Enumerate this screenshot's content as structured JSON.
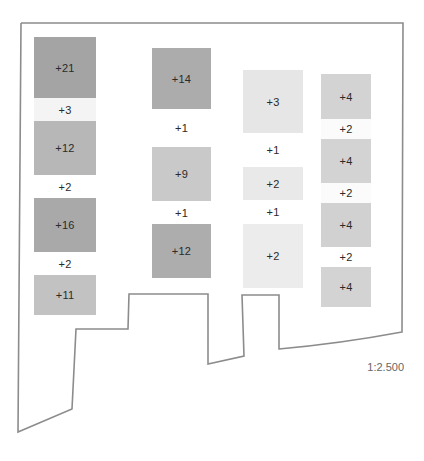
{
  "diagram": {
    "type": "site-plan-density",
    "scale_label": "1:2.500",
    "outline_color": "#8c8c8c",
    "outline_points": [
      [
        21,
        23
      ],
      [
        403,
        23
      ],
      [
        402,
        332
      ],
      [
        279,
        349
      ],
      [
        279,
        295
      ],
      [
        242,
        295
      ],
      [
        244,
        356
      ],
      [
        208,
        364
      ],
      [
        208,
        294
      ],
      [
        129,
        294
      ],
      [
        128,
        329
      ],
      [
        76,
        329
      ],
      [
        72,
        409
      ],
      [
        18,
        432
      ],
      [
        21,
        23
      ]
    ],
    "columns": [
      {
        "name": "column-1",
        "x": 34,
        "width": 62,
        "cells": [
          {
            "label": "+21",
            "top": 37,
            "height": 61,
            "color": "#a4a4a4",
            "kind": "block"
          },
          {
            "label": "+3",
            "top": 98,
            "height": 23,
            "color": "#f4f4f4",
            "kind": "gap"
          },
          {
            "label": "+12",
            "top": 121,
            "height": 54,
            "color": "#b7b7b7",
            "kind": "block"
          },
          {
            "label": "+2",
            "top": 175,
            "height": 23,
            "color": "#ffffff",
            "kind": "gap"
          },
          {
            "label": "+16",
            "top": 198,
            "height": 54,
            "color": "#a9a9a9",
            "kind": "block"
          },
          {
            "label": "+2",
            "top": 252,
            "height": 23,
            "color": "#ffffff",
            "kind": "gap"
          },
          {
            "label": "+11",
            "top": 275,
            "height": 40,
            "color": "#c2c2c2",
            "kind": "block"
          }
        ]
      },
      {
        "name": "column-2",
        "x": 152,
        "width": 59,
        "cells": [
          {
            "label": "+14",
            "top": 48,
            "height": 61,
            "color": "#acacac",
            "kind": "block"
          },
          {
            "label": "+1",
            "top": 109,
            "height": 38,
            "color": "#ffffff",
            "kind": "gap"
          },
          {
            "label": "+9",
            "top": 147,
            "height": 54,
            "color": "#c9c9c9",
            "kind": "block"
          },
          {
            "label": "+1",
            "top": 201,
            "height": 23,
            "color": "#ffffff",
            "kind": "gap"
          },
          {
            "label": "+12",
            "top": 224,
            "height": 54,
            "color": "#adadad",
            "kind": "block"
          }
        ]
      },
      {
        "name": "column-3",
        "x": 243,
        "width": 60,
        "cells": [
          {
            "label": "+3",
            "top": 70,
            "height": 63,
            "color": "#e6e6e6",
            "kind": "block"
          },
          {
            "label": "+1",
            "top": 133,
            "height": 34,
            "color": "#ffffff",
            "kind": "gap"
          },
          {
            "label": "+2",
            "top": 167,
            "height": 33,
            "color": "#e9e9e9",
            "kind": "block"
          },
          {
            "label": "+1",
            "top": 200,
            "height": 24,
            "color": "#ffffff",
            "kind": "gap"
          },
          {
            "label": "+2",
            "top": 224,
            "height": 64,
            "color": "#ececec",
            "kind": "block"
          }
        ]
      },
      {
        "name": "column-4",
        "x": 321,
        "width": 50,
        "cells": [
          {
            "label": "+4",
            "top": 74,
            "height": 45,
            "color": "#d3d3d3",
            "kind": "block"
          },
          {
            "label": "+2",
            "top": 119,
            "height": 20,
            "color": "#fbfbfb",
            "kind": "gap"
          },
          {
            "label": "+4",
            "top": 139,
            "height": 44,
            "color": "#d3d3d3",
            "kind": "block"
          },
          {
            "label": "+2",
            "top": 183,
            "height": 20,
            "color": "#fbfbfb",
            "kind": "gap"
          },
          {
            "label": "+4",
            "top": 203,
            "height": 44,
            "color": "#d1d1d1",
            "kind": "block"
          },
          {
            "label": "+2",
            "top": 247,
            "height": 20,
            "color": "#ffffff",
            "kind": "gap"
          },
          {
            "label": "+4",
            "top": 267,
            "height": 40,
            "color": "#d3d3d3",
            "kind": "block"
          }
        ]
      }
    ]
  }
}
